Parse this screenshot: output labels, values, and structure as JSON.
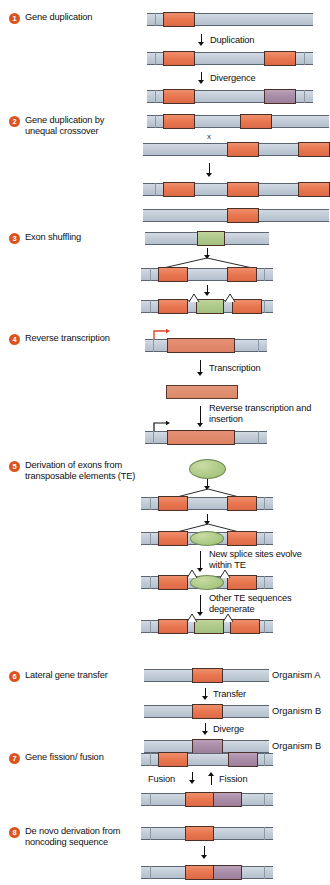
{
  "figure": {
    "accent_color": "#d9541f",
    "colors": {
      "gene_red": "#e8764f",
      "gene_purple": "#a98ca6",
      "gene_green": "#aec98a",
      "dna_backbone": "#c3cdd8",
      "badge": "#d9541f",
      "promoter_arrow": "#e1442a"
    }
  },
  "mechanisms": [
    {
      "number": "1",
      "label": "Gene duplication",
      "steps": [
        "Duplication",
        "Divergence"
      ]
    },
    {
      "number": "2",
      "label": "Gene duplication by unequal crossover",
      "steps": [
        "x"
      ]
    },
    {
      "number": "3",
      "label": "Exon shuffling",
      "steps": []
    },
    {
      "number": "4",
      "label": "Reverse transcription",
      "steps": [
        "Transcription",
        "Reverse transcription and insertion"
      ]
    },
    {
      "number": "5",
      "label": "Derivation of exons from transposable elements (TE)",
      "steps": [
        "New splice sites evolve within TE",
        "Other TE sequences degenerate"
      ]
    },
    {
      "number": "6",
      "label": "Lateral gene transfer",
      "steps": [
        "Transfer",
        "Diverge"
      ],
      "organisms": [
        "Organism A",
        "Organism B",
        "Organism B"
      ]
    },
    {
      "number": "7",
      "label": "Gene fission/ fusion",
      "steps": [
        "Fusion",
        "Fission"
      ]
    },
    {
      "number": "8",
      "label": "De novo derivation from noncoding sequence",
      "steps": []
    }
  ]
}
